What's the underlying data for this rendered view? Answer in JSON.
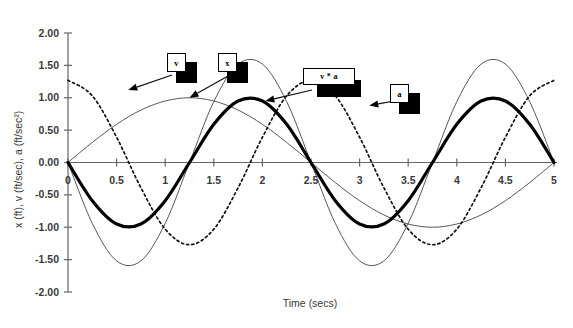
{
  "chart_data": {
    "type": "line",
    "title": "",
    "xlabel": "Time (secs)",
    "ylabel": "x (ft), v (ft/sec), a (ft/sec²)",
    "xlim": [
      0,
      5
    ],
    "ylim": [
      -2.0,
      2.0
    ],
    "grid": false,
    "legend_position": "inline-callouts",
    "xticks": [
      "0",
      "0.5",
      "1",
      "1.5",
      "2",
      "2.5",
      "3",
      "3.5",
      "4",
      "4.5",
      "5"
    ],
    "xtick_values": [
      0,
      0.5,
      1,
      1.5,
      2,
      2.5,
      3,
      3.5,
      4,
      4.5,
      5
    ],
    "yticks": [
      "2.00",
      "1.50",
      "1.00",
      "0.50",
      "0.00",
      "-0.50",
      "-1.00",
      "-1.50",
      "-2.00"
    ],
    "ytick_values": [
      2.0,
      1.5,
      1.0,
      0.5,
      0.0,
      -0.5,
      -1.0,
      -1.5,
      -2.0
    ],
    "x": [
      0,
      0.25,
      0.5,
      0.75,
      1,
      1.25,
      1.5,
      1.75,
      2,
      2.25,
      2.5,
      2.75,
      3,
      3.25,
      3.5,
      3.75,
      4,
      4.25,
      4.5,
      4.75,
      5
    ],
    "series": [
      {
        "name": "x",
        "style": "thick-solid",
        "color": "#000000",
        "values": [
          0.0,
          -0.59,
          -0.95,
          -0.95,
          -0.59,
          0.0,
          0.59,
          0.95,
          0.95,
          0.59,
          0.0,
          -0.59,
          -0.95,
          -0.95,
          -0.59,
          0.0,
          0.59,
          0.95,
          0.95,
          0.59,
          0.0
        ]
      },
      {
        "name": "v",
        "style": "dotted",
        "color": "#000000",
        "values": [
          1.27,
          1.03,
          0.39,
          -0.39,
          -1.03,
          -1.27,
          -1.03,
          -0.39,
          0.39,
          1.03,
          1.27,
          1.03,
          0.39,
          -0.39,
          -1.03,
          -1.27,
          -1.03,
          -0.39,
          0.39,
          1.03,
          1.27
        ]
      },
      {
        "name": "a",
        "style": "thin-solid",
        "color": "#555555",
        "values": [
          0.0,
          -0.94,
          -1.52,
          -1.52,
          -0.94,
          0.0,
          0.94,
          1.52,
          1.52,
          0.94,
          0.0,
          -0.94,
          -1.52,
          -1.52,
          -0.94,
          0.0,
          0.94,
          1.52,
          1.52,
          0.94,
          0.0
        ]
      },
      {
        "name": "v * a",
        "style": "thin-solid",
        "color": "#555555",
        "values": [
          0.0,
          0.31,
          0.59,
          0.81,
          0.95,
          1.0,
          0.95,
          0.81,
          0.59,
          0.31,
          0.0,
          -0.31,
          -0.59,
          -0.81,
          -0.95,
          -1.0,
          -0.95,
          -0.81,
          -0.59,
          -0.31,
          0.0
        ]
      }
    ],
    "annotations": [
      {
        "label": "v",
        "target_x": 0.62,
        "target_y": 1.12
      },
      {
        "label": "x",
        "target_x": 1.25,
        "target_y": 1.0
      },
      {
        "label": "v * a",
        "target_x": 2.03,
        "target_y": 0.95
      },
      {
        "label": "a",
        "target_x": 3.1,
        "target_y": 0.88
      }
    ]
  }
}
